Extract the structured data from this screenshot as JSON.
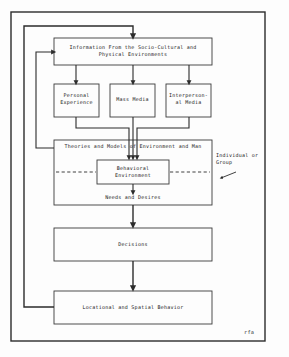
{
  "diagram": {
    "signature": "rfa",
    "frame": {
      "name": "outer-frame"
    },
    "nodes": [
      {
        "id": "information",
        "label": "Information From the Socio-Cultural and\nPhysical Environments"
      },
      {
        "id": "personal",
        "label": "Personal\nExperience"
      },
      {
        "id": "mass-media",
        "label": "Mass Media"
      },
      {
        "id": "interpersonal",
        "label": "Interperson-\nal Media"
      },
      {
        "id": "theories",
        "label": "Theories and Models of Environment and Man"
      },
      {
        "id": "behavioral",
        "label": "Behavioral\nEnvironment"
      },
      {
        "id": "decisions",
        "label": "Decisions"
      },
      {
        "id": "locational",
        "label": "Locational and Spatial Behavior"
      }
    ],
    "edge_labels": [
      {
        "id": "needs-desires",
        "label": "Needs and Desires"
      }
    ],
    "annotations": [
      {
        "id": "individual-or-group",
        "label": "Individual or\nGroup"
      }
    ],
    "colors": {
      "stroke": "#2b2b2b",
      "text": "#1a1a1a",
      "background": "#fdfdfd",
      "frame": "#2b2b2b"
    }
  }
}
